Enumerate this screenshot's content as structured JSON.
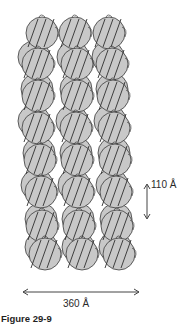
{
  "figure": {
    "caption": "Figure 29-9",
    "dimensions": {
      "vertical": "110 Å",
      "horizontal": "360 Å"
    },
    "colors": {
      "disk_fill": "#c8c8c8",
      "disk_stroke": "#3a3a3a",
      "dna_stroke": "#2f2f2f",
      "background": "#ffffff",
      "arrow": "#444444"
    },
    "structure": {
      "description": "Solenoid-like chromatin fiber model: stacked nucleosome disks wrapped by DNA",
      "columns": 3,
      "rows": 7
    }
  }
}
